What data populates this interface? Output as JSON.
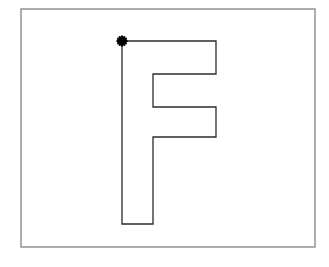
{
  "figure": {
    "title": "Outline drawing of capital letter F with path start marker",
    "canvas": {
      "width": 329,
      "height": 267,
      "background": "#ffffff"
    },
    "frame": {
      "name": "border-frame",
      "x": 21,
      "y": 9,
      "width": 294,
      "height": 238,
      "stroke": "#8c8c8c",
      "stroke_width": 1.4,
      "fill": "#ffffff"
    },
    "shape": {
      "name": "letter-f-outline",
      "label": "F",
      "stroke": "#2b2b2b",
      "stroke_width": 1.3,
      "fill": "none",
      "closed": true,
      "vertices": [
        [
          122,
          41
        ],
        [
          216,
          41
        ],
        [
          216,
          74
        ],
        [
          153,
          74
        ],
        [
          153,
          107
        ],
        [
          216,
          107
        ],
        [
          216,
          137
        ],
        [
          153,
          137
        ],
        [
          153,
          224
        ],
        [
          122,
          224
        ]
      ],
      "path_commands": "M122,41 L216,41 L216,74 L153,74 L153,107 L216,107 L216,137 L153,137 L153,224 L122,224 Z"
    },
    "start_marker": {
      "name": "path-start-asterisk",
      "glyph": "asterisk",
      "x": 122,
      "y": 41,
      "size": 11,
      "stroke": "#000000",
      "stroke_width": 2.1,
      "rays": 6
    }
  },
  "chart_data": {
    "type": "line",
    "xlabel": "",
    "ylabel": "",
    "xlim": [
      21,
      315
    ],
    "ylim": [
      9,
      247
    ],
    "grid": false,
    "legend": "none",
    "series": [
      {
        "name": "letter-f-outline",
        "closed": true,
        "x": [
          122,
          216,
          216,
          153,
          153,
          216,
          216,
          153,
          153,
          122,
          122
        ],
        "y": [
          41,
          41,
          74,
          74,
          107,
          107,
          137,
          137,
          224,
          224,
          41
        ]
      }
    ],
    "annotations": [
      {
        "type": "marker",
        "glyph": "asterisk",
        "x": 122,
        "y": 41,
        "text": ""
      }
    ]
  }
}
